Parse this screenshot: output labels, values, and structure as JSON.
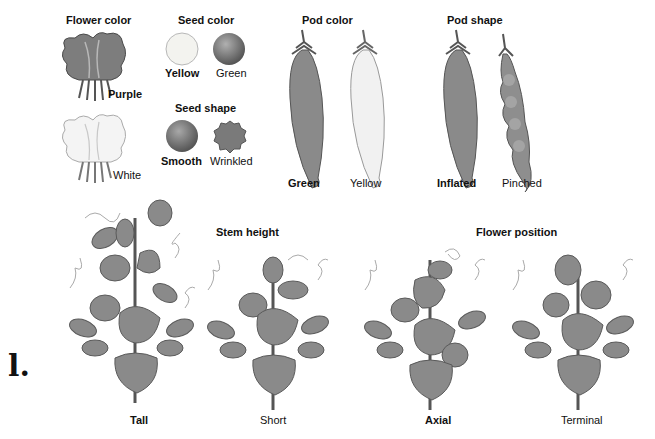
{
  "traits": {
    "flower_color": {
      "title": "Flower color",
      "dominant": "Purple",
      "recessive": "White"
    },
    "seed_color": {
      "title": "Seed color",
      "dominant": "Yellow",
      "recessive": "Green"
    },
    "seed_shape": {
      "title": "Seed shape",
      "dominant": "Smooth",
      "recessive": "Wrinkled"
    },
    "pod_color": {
      "title": "Pod color",
      "dominant": "Green",
      "recessive": "Yellow"
    },
    "pod_shape": {
      "title": "Pod shape",
      "dominant": "Inflated",
      "recessive": "Pinched"
    },
    "stem_height": {
      "title": "Stem height",
      "dominant": "Tall",
      "recessive": "Short"
    },
    "flower_position": {
      "title": "Flower position",
      "dominant": "Axial",
      "recessive": "Terminal"
    }
  },
  "panel_marker": "l.",
  "colors": {
    "plant": "#8a8a8a",
    "plant_dark": "#5e5e5e",
    "light": "#eeeeee",
    "background": "#ffffff"
  }
}
